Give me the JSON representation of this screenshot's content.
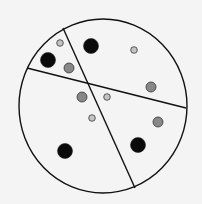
{
  "diagram": {
    "background": "#f4f4f4",
    "stroke": "#111111",
    "circle": {
      "cx": 103,
      "cy": 106,
      "rx": 84,
      "ry": 87
    },
    "lines": [
      {
        "x1": 27,
        "y1": 68,
        "x2": 186,
        "y2": 108
      },
      {
        "x1": 63,
        "y1": 28,
        "x2": 135,
        "y2": 188
      }
    ],
    "dot_styles": {
      "small": {
        "r": 3.3,
        "fill": "#c4c4c4"
      },
      "medium": {
        "r": 5,
        "fill": "#888888"
      },
      "large": {
        "r": 7.5,
        "fill": "#0a0a0a"
      }
    },
    "dots": [
      {
        "x": 60,
        "y": 43,
        "size": "small"
      },
      {
        "x": 134,
        "y": 50,
        "size": "small"
      },
      {
        "x": 107,
        "y": 97,
        "size": "small"
      },
      {
        "x": 92,
        "y": 118,
        "size": "small"
      },
      {
        "x": 69,
        "y": 68,
        "size": "medium"
      },
      {
        "x": 151,
        "y": 87,
        "size": "medium"
      },
      {
        "x": 82,
        "y": 97,
        "size": "medium"
      },
      {
        "x": 158,
        "y": 122,
        "size": "medium"
      },
      {
        "x": 91,
        "y": 46,
        "size": "large"
      },
      {
        "x": 48,
        "y": 60,
        "size": "large"
      },
      {
        "x": 65,
        "y": 151,
        "size": "large"
      },
      {
        "x": 138,
        "y": 145,
        "size": "large"
      }
    ]
  }
}
